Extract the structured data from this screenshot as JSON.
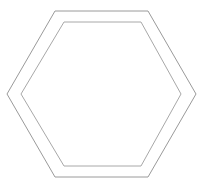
{
  "figure": {
    "background_color": "#ffffff",
    "width": 208,
    "height": 189,
    "shapes": [
      {
        "name": "outer-hexagon",
        "type": "hexagon",
        "orientation": "pointy-side-horizontal",
        "stroke_color": "#9a9a9a",
        "stroke_width": 1,
        "fill": "none",
        "points": "55,11 148,11 196,94 148,177 55,177 7,94"
      },
      {
        "name": "inner-hexagon",
        "type": "hexagon",
        "orientation": "pointy-side-horizontal",
        "stroke_color": "#a8a8a8",
        "stroke_width": 1,
        "fill": "none",
        "points": "64,22 141,22 181,94 141,166 64,166 21,94"
      }
    ]
  }
}
